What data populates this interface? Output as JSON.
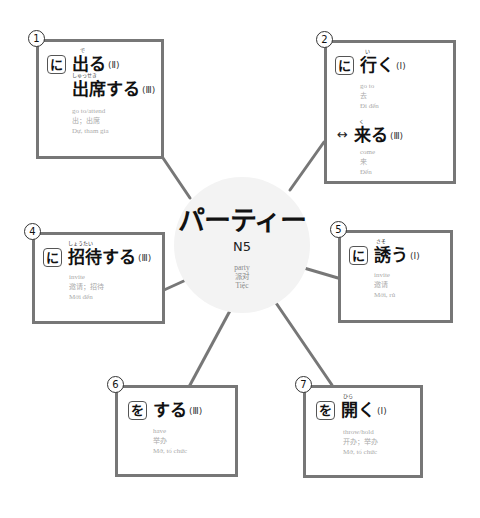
{
  "hub": {
    "title": "パーティー",
    "level": "N5",
    "gloss": {
      "en": "party",
      "zh": "派对",
      "vi": "Tiệc"
    }
  },
  "colors": {
    "border": "#777777",
    "hub_fill": "#f3f3f3",
    "gloss_text": "#aaaaaa"
  },
  "nodes": [
    {
      "num": "1",
      "particle": "に",
      "words": [
        {
          "reading": "で",
          "kanji": "出る",
          "class": "(Ⅱ)"
        },
        {
          "reading": "しゅっせき",
          "kanji": "出席する",
          "class": "(Ⅲ)"
        }
      ],
      "gloss": {
        "en": "go to/attend",
        "zh": "出；出席",
        "vi": "Dự, tham gia"
      }
    },
    {
      "num": "2",
      "particle": "に",
      "words": [
        {
          "reading": "い",
          "kanji": "行く",
          "class": "(Ⅰ)"
        }
      ],
      "gloss": {
        "en": "go to",
        "zh": "去",
        "vi": "Đi đến"
      },
      "antonym": {
        "arrow": "↔",
        "reading": "く",
        "kanji": "来る",
        "class": "(Ⅲ)",
        "gloss": {
          "en": "come",
          "zh": "来",
          "vi": "Đến"
        }
      }
    },
    {
      "num": "4",
      "particle": "に",
      "words": [
        {
          "reading": "しょうたい",
          "kanji": "招待する",
          "class": "(Ⅲ)"
        }
      ],
      "gloss": {
        "en": "invite",
        "zh": "邀请；招待",
        "vi": "Mời đến"
      }
    },
    {
      "num": "5",
      "particle": "に",
      "words": [
        {
          "reading": "さそ",
          "kanji": "誘う",
          "class": "(Ⅰ)"
        }
      ],
      "gloss": {
        "en": "invite",
        "zh": "邀请",
        "vi": "Mời, rủ"
      }
    },
    {
      "num": "6",
      "particle": "を",
      "words": [
        {
          "reading": "",
          "kanji": "する",
          "class": "(Ⅲ)"
        }
      ],
      "gloss": {
        "en": "have",
        "zh": "举办",
        "vi": "Mở, tổ chức"
      }
    },
    {
      "num": "7",
      "particle": "を",
      "words": [
        {
          "reading": "ひら",
          "kanji": "開く",
          "class": "(Ⅰ)"
        }
      ],
      "gloss": {
        "en": "throw/hold",
        "zh": "开办；举办",
        "vi": "Mở, tổ chức"
      }
    }
  ]
}
